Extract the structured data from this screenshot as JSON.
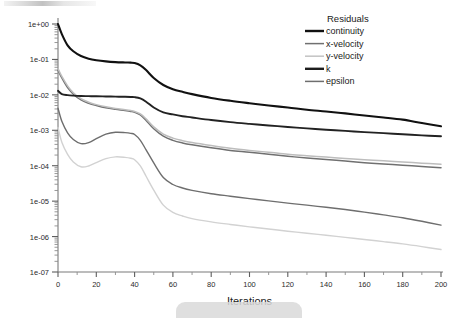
{
  "chart_data": {
    "type": "line",
    "title": "",
    "xlabel": "Iterations",
    "ylabel": "",
    "xlim": [
      0,
      200
    ],
    "ylim": [
      1e-07,
      1.0
    ],
    "yscale": "log",
    "grid": false,
    "legend_position": "top-right",
    "legend_title": "Residuals",
    "xticks": [
      "0",
      "20",
      "40",
      "60",
      "80",
      "100",
      "120",
      "140",
      "160",
      "180",
      "200"
    ],
    "xtick_values": [
      0,
      20,
      40,
      60,
      80,
      100,
      120,
      140,
      160,
      180,
      200
    ],
    "yticks": [
      "1e+00",
      "1e-01",
      "1e-02",
      "1e-03",
      "1e-04",
      "1e-05",
      "1e-06",
      "1e-07"
    ],
    "ytick_values": [
      1.0,
      0.1,
      0.01,
      0.001,
      0.0001,
      1e-05,
      1e-06,
      1e-07
    ],
    "x": [
      0,
      2,
      5,
      8,
      12,
      16,
      20,
      25,
      30,
      35,
      38,
      40,
      43,
      46,
      50,
      55,
      60,
      65,
      70,
      80,
      90,
      100,
      110,
      120,
      130,
      140,
      150,
      160,
      170,
      180,
      190,
      200
    ],
    "series": [
      {
        "name": "continuity",
        "color": "#111111",
        "width": 2.1,
        "values": [
          1.0,
          0.52,
          0.25,
          0.17,
          0.125,
          0.105,
          0.095,
          0.088,
          0.084,
          0.082,
          0.081,
          0.079,
          0.068,
          0.05,
          0.03,
          0.019,
          0.0145,
          0.0122,
          0.0105,
          0.0082,
          0.0068,
          0.0058,
          0.005,
          0.0044,
          0.0038,
          0.0034,
          0.003,
          0.0026,
          0.0023,
          0.002,
          0.0016,
          0.0013
        ]
      },
      {
        "name": "x-velocity",
        "color": "#707070",
        "width": 1.5,
        "values": [
          0.05,
          0.03,
          0.016,
          0.0105,
          0.0072,
          0.0058,
          0.005,
          0.0043,
          0.0039,
          0.0036,
          0.0034,
          0.0032,
          0.0027,
          0.0019,
          0.0011,
          0.00068,
          0.00052,
          0.00044,
          0.00039,
          0.00032,
          0.00027,
          0.00024,
          0.00021,
          0.000185,
          0.000165,
          0.00015,
          0.000135,
          0.000122,
          0.000112,
          0.000103,
          9.55e-05,
          8.8e-05
        ]
      },
      {
        "name": "y-velocity",
        "color": "#bdbdbd",
        "width": 1.5,
        "values": [
          0.055,
          0.033,
          0.018,
          0.0115,
          0.0078,
          0.0062,
          0.0053,
          0.0046,
          0.0041,
          0.0038,
          0.0036,
          0.0034,
          0.0029,
          0.0021,
          0.00125,
          0.00078,
          0.0006,
          0.00051,
          0.00045,
          0.00037,
          0.00031,
          0.00027,
          0.00024,
          0.00021,
          0.000192,
          0.000175,
          0.00016,
          0.000148,
          0.000137,
          0.000128,
          0.000118,
          0.00011
        ]
      },
      {
        "name": "k",
        "color": "#222222",
        "width": 1.9,
        "values": [
          0.013,
          0.0105,
          0.0098,
          0.0095,
          0.0093,
          0.0092,
          0.0091,
          0.009,
          0.0089,
          0.0088,
          0.0087,
          0.0086,
          0.0079,
          0.0064,
          0.0044,
          0.0032,
          0.0028,
          0.0025,
          0.0023,
          0.00195,
          0.0017,
          0.00152,
          0.00137,
          0.00124,
          0.00113,
          0.00104,
          0.00096,
          0.00089,
          0.00083,
          0.00077,
          0.00072,
          0.00068
        ]
      },
      {
        "name": "epsilon",
        "color": "#6e6e6e",
        "width": 1.4,
        "values": [
          0.0042,
          0.0018,
          0.00085,
          0.00055,
          0.00042,
          0.00045,
          0.00058,
          0.00078,
          0.00088,
          0.00086,
          0.00082,
          0.00076,
          0.00052,
          0.00028,
          0.00012,
          4.65e-05,
          2.95e-05,
          2.35e-05,
          2.02e-05,
          1.62e-05,
          1.38e-05,
          1.18e-05,
          1.02e-05,
          8.8e-06,
          7.7e-06,
          6.7e-06,
          5.8e-06,
          4.9e-06,
          4.1e-06,
          3.4e-06,
          2.7e-06,
          2.1e-06
        ]
      }
    ],
    "series_low": [
      {
        "name": "epsilon-low",
        "color": "#d2d2d2",
        "width": 1.4,
        "values": [
          0.0012,
          0.00046,
          0.00021,
          0.000128,
          9.35e-05,
          9.85e-05,
          0.000122,
          0.000158,
          0.000178,
          0.000172,
          0.000162,
          0.000148,
          9.85e-05,
          5.05e-05,
          2.05e-05,
          7.7e-06,
          4.8e-06,
          3.8e-06,
          3.2e-06,
          2.6e-06,
          2.2e-06,
          1.88e-06,
          1.63e-06,
          1.42e-06,
          1.24e-06,
          1.09e-06,
          9.5e-07,
          8.3e-07,
          7.2e-07,
          6.2e-07,
          5.2e-07,
          4.3e-07
        ]
      }
    ]
  },
  "legend": {
    "title": "Residuals",
    "entries": [
      {
        "label": "continuity",
        "color": "#111111",
        "width": 2.4
      },
      {
        "label": "x-velocity",
        "color": "#707070",
        "width": 1.5
      },
      {
        "label": "y-velocity",
        "color": "#c6c6c6",
        "width": 1.6
      },
      {
        "label": "k",
        "color": "#1d1d1d",
        "width": 2.4
      },
      {
        "label": "epsilon",
        "color": "#6e6e6e",
        "width": 1.5
      }
    ]
  },
  "axes": {
    "x_title": "Iterations"
  }
}
